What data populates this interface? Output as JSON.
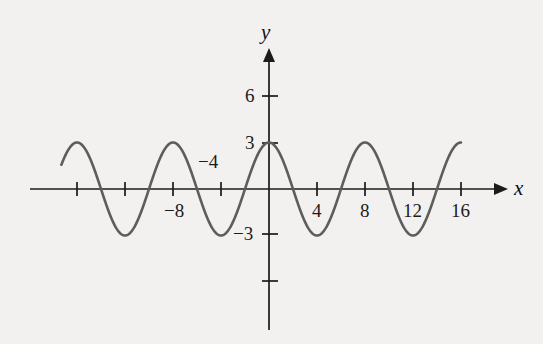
{
  "figure": {
    "background_color": "#f3f1ef",
    "curve_color": "#5d5d5d",
    "axis_color": "#1b1b1b",
    "x_axis_name": "x",
    "y_axis_name": "y"
  },
  "labels": {
    "x": [
      {
        "text": "−8",
        "value": -8,
        "px_x": 173,
        "px_y": 199,
        "place": "below"
      },
      {
        "text": "−4",
        "value": -4,
        "px_x": 211,
        "px_y": 150,
        "place": "above"
      },
      {
        "text": "4",
        "value": 4,
        "px_x": 317,
        "px_y": 199,
        "place": "below"
      },
      {
        "text": "8",
        "value": 8,
        "px_x": 365,
        "px_y": 199,
        "place": "below"
      },
      {
        "text": "12",
        "value": 12,
        "px_x": 413,
        "px_y": 199,
        "place": "below"
      },
      {
        "text": "16",
        "value": 16,
        "px_x": 461,
        "px_y": 199,
        "place": "below"
      }
    ],
    "y": [
      {
        "text": "6",
        "value": 6,
        "px_x": 247,
        "px_y": 96
      },
      {
        "text": "3",
        "value": 3,
        "px_x": 247,
        "px_y": 143
      },
      {
        "text": "−3",
        "value": -3,
        "px_x": 238,
        "px_y": 234
      }
    ]
  },
  "chart_data": {
    "type": "line",
    "title": "",
    "xlabel": "x",
    "ylabel": "y",
    "grid": false,
    "legend": "none",
    "xlim": [
      -17.5,
      18.5
    ],
    "ylim": [
      -7.5,
      7.5
    ],
    "x_ticks": [
      -16,
      -12,
      -8,
      -4,
      4,
      8,
      12,
      16
    ],
    "x_tick_labels": [
      "",
      "",
      "−8",
      "−4",
      "4",
      "8",
      "12",
      "16"
    ],
    "y_ticks": [
      6,
      3,
      -3,
      -6
    ],
    "y_tick_labels": [
      "6",
      "3",
      "−3",
      ""
    ],
    "series": [
      {
        "name": "y = 3 cos(πx/4)",
        "function": "3*cos(pi*x/4)",
        "amplitude": 3,
        "period": 8,
        "phase": 0,
        "midline": 0,
        "x_start": -17.3,
        "x_end": 16.0,
        "maxima_x": [
          -16,
          -8,
          0,
          8,
          16
        ],
        "maxima_y": 3,
        "minima_x": [
          -12,
          -4,
          4,
          12
        ],
        "minima_y": -3,
        "zeros_x": [
          -14,
          -10,
          -6,
          -2,
          2,
          6,
          10,
          14
        ]
      }
    ]
  },
  "axis_geometry": {
    "origin_px_x": 269,
    "origin_px_y": 189,
    "px_per_x_unit": 12,
    "px_per_y_unit": 15.5,
    "x_axis_left_px": 30,
    "x_axis_right_px": 502,
    "y_axis_top_px": 52,
    "y_axis_bottom_px": 330
  }
}
